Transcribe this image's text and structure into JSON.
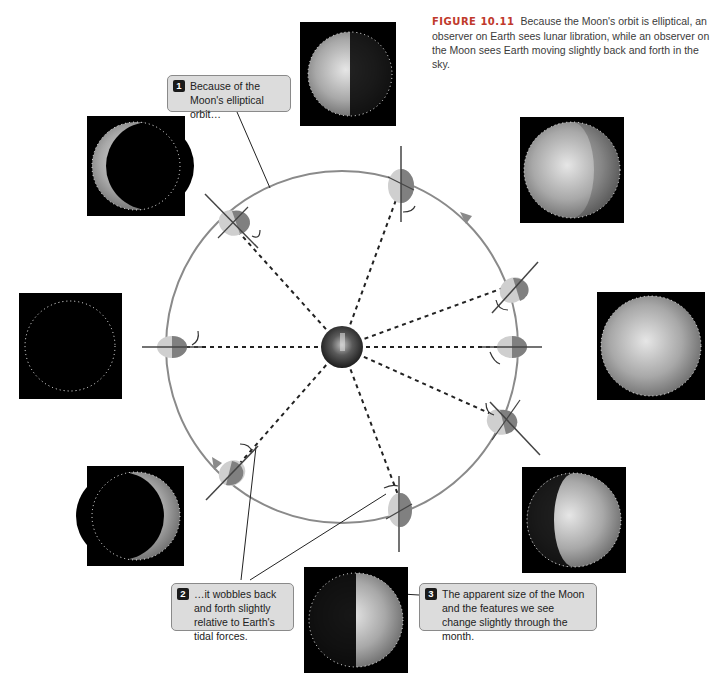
{
  "figure": {
    "label": "FIGURE 10.11",
    "caption": "Because the Moon's orbit is elliptical, an observer on Earth sees lunar libration, while an observer on the Moon sees Earth moving slightly back and forth in the sky."
  },
  "callouts": [
    {
      "num": "1",
      "text": "Because of the Moon's elliptical orbit…"
    },
    {
      "num": "2",
      "text": "…it wobbles back and forth slightly relative to Earth's tidal forces."
    },
    {
      "num": "3",
      "text": "The apparent size of the Moon and the features we see change slightly through the month."
    }
  ],
  "diagram": {
    "center_body": "Earth",
    "orbit_color": "#8a8a8a",
    "moon_light_color": "#cfcfcf",
    "moon_dark_color": "#808080",
    "phase_images": [
      {
        "position": "top",
        "phase": "waning gibbous / last quarter"
      },
      {
        "position": "upper-left",
        "phase": "waning crescent"
      },
      {
        "position": "left",
        "phase": "new moon"
      },
      {
        "position": "lower-left",
        "phase": "waxing crescent"
      },
      {
        "position": "bottom",
        "phase": "first quarter"
      },
      {
        "position": "lower-right",
        "phase": "waxing gibbous"
      },
      {
        "position": "right",
        "phase": "full moon"
      },
      {
        "position": "upper-right",
        "phase": "waning gibbous"
      }
    ]
  }
}
